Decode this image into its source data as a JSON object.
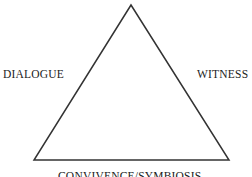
{
  "diagram": {
    "shape": "triangle",
    "labels": {
      "left": "DIALOGUE",
      "right": "WITNESS",
      "bottom": "CONVIVENCE/SYMBIOSIS"
    },
    "colors": {
      "line": "#333333",
      "text": "#222222"
    }
  }
}
